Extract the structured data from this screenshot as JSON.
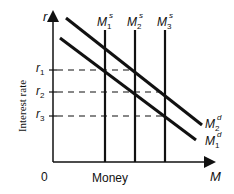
{
  "diagram": {
    "title": "",
    "y_axis": {
      "symbol": "r",
      "label": "Interest rate"
    },
    "x_axis": {
      "symbol": "M",
      "label": "Money"
    },
    "origin": "0",
    "rates": [
      {
        "name": "r",
        "sub": "1"
      },
      {
        "name": "r",
        "sub": "2"
      },
      {
        "name": "r",
        "sub": "3"
      }
    ],
    "supply": [
      {
        "name": "M",
        "sub": "1",
        "sup": "s"
      },
      {
        "name": "M",
        "sub": "2",
        "sup": "s"
      },
      {
        "name": "M",
        "sub": "3",
        "sup": "s"
      }
    ],
    "demand": [
      {
        "name": "M",
        "sub": "2",
        "sup": "d"
      },
      {
        "name": "M",
        "sub": "1",
        "sup": "d"
      }
    ],
    "line_color": "#111111"
  }
}
